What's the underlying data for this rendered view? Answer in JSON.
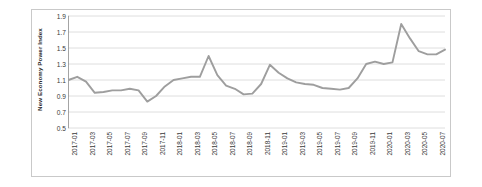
{
  "figure": {
    "background_color": "#ffffff",
    "border_color": "#c9c9c9",
    "line_color": "#9e9e9e",
    "grid_color": "#d6d6d6",
    "axis_color": "#9a9a9a"
  },
  "chart_data": {
    "type": "line",
    "title": "",
    "xlabel": "",
    "ylabel": "New Economy Power Index",
    "ylim": [
      0.5,
      1.9
    ],
    "yticks": [
      0.5,
      0.7,
      0.9,
      1.1,
      1.3,
      1.5,
      1.7,
      1.9
    ],
    "ytick_labels": [
      "0.5",
      "0.7",
      "0.9",
      "1.1",
      "1.3",
      "1.5",
      "1.7",
      "1.9"
    ],
    "grid": "horizontal",
    "legend": "none",
    "series_name": "New Economy Power Index",
    "x": [
      "2017-01",
      "2017-02",
      "2017-03",
      "2017-04",
      "2017-05",
      "2017-06",
      "2017-07",
      "2017-08",
      "2017-09",
      "2017-10",
      "2017-11",
      "2017-12",
      "2018-01",
      "2018-02",
      "2018-03",
      "2018-04",
      "2018-05",
      "2018-06",
      "2018-07",
      "2018-08",
      "2018-09",
      "2018-10",
      "2018-11",
      "2018-12",
      "2019-01",
      "2019-02",
      "2019-03",
      "2019-04",
      "2019-05",
      "2019-06",
      "2019-07",
      "2019-08",
      "2019-09",
      "2019-10",
      "2019-11",
      "2019-12",
      "2020-01",
      "2020-02",
      "2020-03",
      "2020-04",
      "2020-05",
      "2020-06",
      "2020-07",
      "2020-08"
    ],
    "values": [
      1.1,
      1.14,
      1.08,
      0.94,
      0.95,
      0.97,
      0.97,
      0.99,
      0.97,
      0.83,
      0.9,
      1.02,
      1.1,
      1.12,
      1.14,
      1.14,
      1.4,
      1.16,
      1.03,
      0.99,
      0.92,
      0.93,
      1.05,
      1.29,
      1.19,
      1.12,
      1.07,
      1.05,
      1.04,
      1.0,
      0.99,
      0.98,
      1.0,
      1.12,
      1.3,
      1.33,
      1.3,
      1.32,
      1.8,
      1.62,
      1.46,
      1.42,
      1.42,
      1.48
    ],
    "xtick_labels": [
      "2017-01",
      "2017-03",
      "2017-05",
      "2017-07",
      "2017-09",
      "2017-11",
      "2018-01",
      "2018-03",
      "2018-05",
      "2018-07",
      "2018-09",
      "2018-11",
      "2019-01",
      "2019-03",
      "2019-05",
      "2019-07",
      "2019-09",
      "2019-11",
      "2020-01",
      "2020-03",
      "2020-05",
      "2020-07"
    ],
    "xtick_indices": [
      0,
      2,
      4,
      6,
      8,
      10,
      12,
      14,
      16,
      18,
      20,
      22,
      24,
      26,
      28,
      30,
      32,
      34,
      36,
      38,
      40,
      42
    ]
  }
}
